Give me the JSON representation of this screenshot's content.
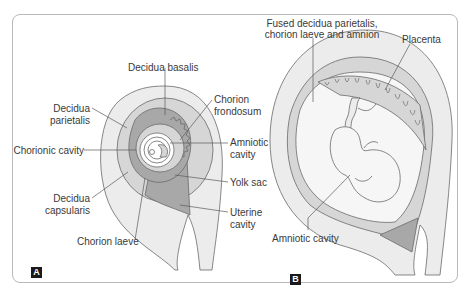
{
  "figure": {
    "panels": [
      {
        "id": "A",
        "tag": "A",
        "labels": {
          "decidua_basalis": "Decidua basalis",
          "decidua_parietalis_1": "Decidua",
          "decidua_parietalis_2": "parietalis",
          "chorion_frondosum_1": "Chorion",
          "chorion_frondosum_2": "frondosum",
          "chorionic_cavity": "Chorionic cavity",
          "amniotic_cavity_1": "Amniotic",
          "amniotic_cavity_2": "cavity",
          "yolk_sac": "Yolk sac",
          "decidua_capsularis_1": "Decidua",
          "decidua_capsularis_2": "capsularis",
          "uterine_cavity_1": "Uterine",
          "uterine_cavity_2": "cavity",
          "chorion_laeve": "Chorion laeve"
        }
      },
      {
        "id": "B",
        "tag": "B",
        "labels": {
          "fused_1": "Fused decidua parietalis,",
          "fused_2": "chorion laeve and amnion",
          "placenta": "Placenta",
          "amniotic_cavity": "Amniotic cavity"
        }
      }
    ],
    "colors": {
      "uterine_wall": "#ececec",
      "decidua": "#d6d6d6",
      "dark_tissue": "#a8a8a8",
      "outline": "#6a6a6a",
      "text": "#3a3a3a"
    }
  }
}
